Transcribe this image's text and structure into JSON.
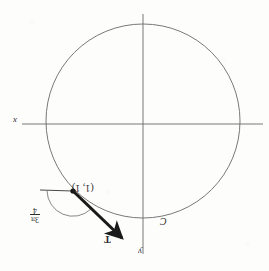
{
  "figure": {
    "orientation_note": "scan is rotated 180 degrees; all text reads upside-down",
    "background_color": "#fdfdfc",
    "ink_color": "#2b2b2b",
    "axis_color": "#6a6a6a",
    "curve_color": "#6a6a6a",
    "vector_color": "#1a1a1a"
  },
  "labels": {
    "axis_x": "x",
    "axis_y": "y",
    "curve": "C",
    "point": "(1, 1)",
    "vector": "T",
    "angle_numerator": "3π",
    "angle_denominator": "4"
  },
  "geometry": {
    "circle": {
      "cx": 143,
      "cy": 121,
      "r": 97
    },
    "axis_horizontal": {
      "x1": 22,
      "y1": 124,
      "x2": 263,
      "y2": 124
    },
    "axis_vertical": {
      "x1": 143,
      "y1": 14,
      "x2": 143,
      "y2": 254
    },
    "point": {
      "x": 73,
      "y": 191
    },
    "reference_ray": {
      "x1": 40,
      "y1": 190,
      "x2": 73,
      "y2": 191
    },
    "vector_arrow": {
      "x1": 73,
      "y1": 191,
      "x2": 127,
      "y2": 243
    },
    "angle_arc": {
      "cx": 73,
      "cy": 191,
      "r": 26
    }
  }
}
